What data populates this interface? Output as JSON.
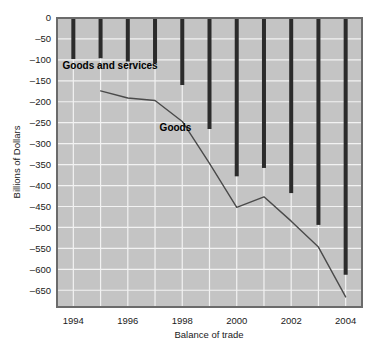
{
  "chart_data": {
    "type": "bar",
    "title": "",
    "subtitle": "",
    "xlabel": "Balance of trade",
    "ylabel": "Billions of Dollars",
    "grid": true,
    "legend_position": "inline-annotations",
    "x": [
      1994,
      1995,
      1996,
      1997,
      1998,
      1999,
      2000,
      2001,
      2002,
      2003,
      2004
    ],
    "xlim": [
      1993.4,
      2004.6
    ],
    "ylim": [
      -690,
      0
    ],
    "x_tick_labels": [
      "1994",
      "1996",
      "1998",
      "2000",
      "2002",
      "2004"
    ],
    "x_tick_values": [
      1994,
      1996,
      1998,
      2000,
      2002,
      2004
    ],
    "y_tick_labels": [
      "0",
      "–50",
      "–100",
      "–150",
      "–200",
      "–250",
      "–300",
      "–350",
      "–400",
      "–450",
      "–500",
      "–550",
      "–600",
      "–650"
    ],
    "y_tick_values": [
      0,
      -50,
      -100,
      -150,
      -200,
      -250,
      -300,
      -350,
      -400,
      -450,
      -500,
      -550,
      -600,
      -650
    ],
    "series": [
      {
        "name": "Goods and services",
        "render": "bar",
        "color": "#2b2b2b",
        "values": [
          -98,
          -96,
          -104,
          -108,
          -160,
          -265,
          -378,
          -358,
          -418,
          -494,
          -613
        ]
      },
      {
        "name": "Goods",
        "render": "line",
        "color": "#4a4a4a",
        "x": [
          1995,
          1996,
          1997,
          1998,
          1999,
          2000,
          2001,
          2002,
          2003,
          2004
        ],
        "values": [
          -174,
          -191,
          -197,
          -247,
          -347,
          -452,
          -427,
          -485,
          -547,
          -666
        ]
      }
    ],
    "annotations": [
      {
        "text": "Goods and services",
        "x": 1995.35,
        "y": -122
      },
      {
        "text": "Goods",
        "x": 1997.75,
        "y": -270
      }
    ],
    "colors": {
      "plot_background": "#c4c4c4",
      "gridline": "#f2f2f2",
      "plot_border": "#6b6b6b",
      "bar": "#2b2b2b",
      "line": "#4a4a4a",
      "text": "#1a1a1a",
      "page_background": "#ffffff"
    }
  }
}
